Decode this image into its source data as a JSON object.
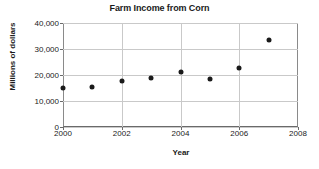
{
  "chart_data": {
    "type": "scatter",
    "title": "Farm Income from Corn",
    "xlabel": "Year",
    "ylabel": "Millions of dollars",
    "x": [
      2000,
      2001,
      2002,
      2003,
      2004,
      2005,
      2006,
      2007
    ],
    "values": [
      15000,
      15400,
      17800,
      18800,
      21000,
      18300,
      22700,
      33500
    ],
    "xlim": [
      2000,
      2008
    ],
    "ylim": [
      0,
      40000
    ],
    "xticks": [
      2000,
      2002,
      2004,
      2006,
      2008
    ],
    "xtick_labels": [
      "2000",
      "2002",
      "2004",
      "2006",
      "2008"
    ],
    "yticks": [
      0,
      10000,
      20000,
      30000,
      40000
    ],
    "ytick_labels": [
      "0",
      "10,000",
      "20,000",
      "30,000",
      "40,000"
    ],
    "grid": true,
    "legend": null,
    "marker_color": "#1a1a1a",
    "grid_color": "#c9c9c9",
    "background": "#ffffff"
  }
}
